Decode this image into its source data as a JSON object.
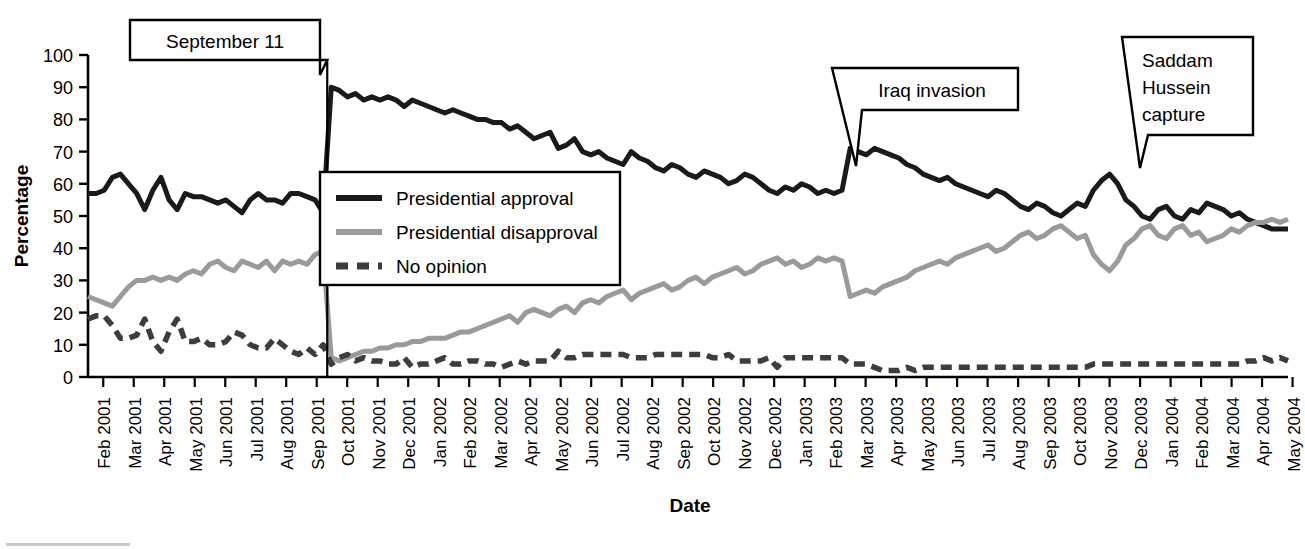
{
  "figure": {
    "background": "#ffffff",
    "axis_color": "#000000"
  },
  "axes": {
    "ylabel": "Percentage",
    "xlabel": "Date",
    "y_ticks": [
      "0",
      "10",
      "20",
      "30",
      "40",
      "50",
      "60",
      "70",
      "80",
      "90",
      "100"
    ],
    "x_ticks": [
      "Feb 2001",
      "Mar 2001",
      "Apr 2001",
      "May 2001",
      "Jun 2001",
      "Jul 2001",
      "Aug 2001",
      "Sep 2001",
      "Oct 2001",
      "Nov 2001",
      "Dec 2001",
      "Jan 2002",
      "Feb 2002",
      "Mar 2002",
      "Apr 2002",
      "May 2002",
      "Jun 2002",
      "Jul 2002",
      "Aug 2002",
      "Sep 2002",
      "Oct 2002",
      "Nov 2002",
      "Dec 2002",
      "Jan 2003",
      "Feb 2003",
      "Mar 2003",
      "Apr 2003",
      "May 2003",
      "Jun 2003",
      "Jul 2003",
      "Aug 2003",
      "Sep 2003",
      "Oct 2003",
      "Nov 2003",
      "Dec 2003",
      "Jan 2004",
      "Feb 2004",
      "Mar 2004",
      "Apr 2004",
      "May 2004"
    ]
  },
  "legend": {
    "position": "inside-upper-left",
    "entries": [
      {
        "label": "Presidential approval",
        "color": "#1a1a1a",
        "style": "solid"
      },
      {
        "label": "Presidential disapproval",
        "color": "#9a9a9a",
        "style": "solid"
      },
      {
        "label": "No opinion",
        "color": "#3d3d3d",
        "style": "dashed"
      }
    ]
  },
  "annotations": [
    {
      "name": "september-11",
      "text": "September 11",
      "lines": [
        "September 11"
      ]
    },
    {
      "name": "iraq-invasion",
      "text": "Iraq invasion",
      "lines": [
        "Iraq invasion"
      ]
    },
    {
      "name": "saddam-hussein-capture",
      "text": "Saddam Hussein capture",
      "lines": [
        "Saddam",
        "Hussein",
        "capture"
      ]
    }
  ],
  "chart_data": {
    "type": "line",
    "title": "",
    "xlabel": "Date",
    "ylabel": "Percentage",
    "ylim": [
      0,
      100
    ],
    "ytick_step": 10,
    "grid": false,
    "legend_position": "inside upper-left",
    "x_unit": "poll (approximately weekly, Feb 2001 - May 2004)",
    "x_axis_labels": [
      "Feb 2001",
      "Mar 2001",
      "Apr 2001",
      "May 2001",
      "Jun 2001",
      "Jul 2001",
      "Aug 2001",
      "Sep 2001",
      "Oct 2001",
      "Nov 2001",
      "Dec 2001",
      "Jan 2002",
      "Feb 2002",
      "Mar 2002",
      "Apr 2002",
      "May 2002",
      "Jun 2002",
      "Jul 2002",
      "Aug 2002",
      "Sep 2002",
      "Oct 2002",
      "Nov 2002",
      "Dec 2002",
      "Jan 2003",
      "Feb 2003",
      "Mar 2003",
      "Apr 2003",
      "May 2003",
      "Jun 2003",
      "Jul 2003",
      "Aug 2003",
      "Sep 2003",
      "Oct 2003",
      "Nov 2003",
      "Dec 2003",
      "Jan 2004",
      "Feb 2004",
      "Mar 2004",
      "Apr 2004",
      "May 2004"
    ],
    "events": [
      {
        "label": "September 11",
        "x_index": 30
      },
      {
        "label": "Iraq invasion",
        "x_index": 94
      },
      {
        "label": "Saddam Hussein capture",
        "x_index": 124
      }
    ],
    "series": [
      {
        "name": "Presidential approval",
        "color": "#1a1a1a",
        "style": "solid",
        "values": [
          57,
          57,
          58,
          62,
          63,
          60,
          57,
          52,
          58,
          62,
          55,
          52,
          57,
          56,
          56,
          55,
          54,
          55,
          53,
          51,
          55,
          57,
          55,
          55,
          54,
          57,
          57,
          56,
          55,
          51,
          90,
          89,
          87,
          88,
          86,
          87,
          86,
          87,
          86,
          84,
          86,
          85,
          84,
          83,
          82,
          83,
          82,
          81,
          80,
          80,
          79,
          79,
          77,
          78,
          76,
          74,
          75,
          76,
          71,
          72,
          74,
          70,
          69,
          70,
          68,
          67,
          66,
          70,
          68,
          67,
          65,
          64,
          66,
          65,
          63,
          62,
          64,
          63,
          62,
          60,
          61,
          63,
          62,
          60,
          58,
          57,
          59,
          58,
          60,
          59,
          57,
          58,
          57,
          58,
          71,
          70,
          69,
          71,
          70,
          69,
          68,
          66,
          65,
          63,
          62,
          61,
          62,
          60,
          59,
          58,
          57,
          56,
          58,
          57,
          55,
          53,
          52,
          54,
          53,
          51,
          50,
          52,
          54,
          53,
          58,
          61,
          63,
          60,
          55,
          53,
          50,
          49,
          52,
          53,
          50,
          49,
          52,
          51,
          54,
          53,
          52,
          50,
          51,
          49,
          48,
          47,
          46,
          46,
          46
        ],
        "n": 159
      },
      {
        "name": "Presidential disapproval",
        "color": "#9a9a9a",
        "style": "solid",
        "values": [
          25,
          24,
          23,
          22,
          25,
          28,
          30,
          30,
          31,
          30,
          31,
          30,
          32,
          33,
          32,
          35,
          36,
          34,
          33,
          36,
          35,
          34,
          36,
          33,
          36,
          35,
          36,
          35,
          38,
          39,
          6,
          5,
          6,
          7,
          8,
          8,
          9,
          9,
          10,
          10,
          11,
          11,
          12,
          12,
          12,
          13,
          14,
          14,
          15,
          16,
          17,
          18,
          19,
          17,
          20,
          21,
          20,
          19,
          21,
          22,
          20,
          23,
          24,
          23,
          25,
          26,
          27,
          24,
          26,
          27,
          28,
          29,
          27,
          28,
          30,
          31,
          29,
          31,
          32,
          33,
          34,
          32,
          33,
          35,
          36,
          37,
          35,
          36,
          34,
          35,
          37,
          36,
          37,
          36,
          25,
          26,
          27,
          26,
          28,
          29,
          30,
          31,
          33,
          34,
          35,
          36,
          35,
          37,
          38,
          39,
          40,
          41,
          39,
          40,
          42,
          44,
          45,
          43,
          44,
          46,
          47,
          45,
          43,
          44,
          38,
          35,
          33,
          36,
          41,
          43,
          46,
          47,
          44,
          43,
          46,
          47,
          44,
          45,
          42,
          43,
          44,
          46,
          45,
          47,
          48,
          48,
          49,
          48,
          49
        ],
        "n": 159
      },
      {
        "name": "No opinion",
        "color": "#3d3d3d",
        "style": "dashed",
        "values": [
          18,
          19,
          19,
          16,
          12,
          12,
          13,
          18,
          11,
          8,
          14,
          18,
          11,
          11,
          12,
          10,
          10,
          11,
          14,
          13,
          10,
          9,
          9,
          12,
          10,
          8,
          7,
          9,
          7,
          10,
          4,
          6,
          7,
          5,
          6,
          5,
          5,
          4,
          4,
          6,
          3,
          4,
          4,
          5,
          6,
          4,
          4,
          5,
          5,
          4,
          4,
          3,
          4,
          5,
          4,
          5,
          5,
          5,
          8,
          6,
          6,
          7,
          7,
          7,
          7,
          7,
          7,
          6,
          6,
          6,
          7,
          7,
          7,
          7,
          7,
          7,
          7,
          6,
          6,
          7,
          5,
          5,
          5,
          5,
          6,
          3,
          6,
          6,
          6,
          6,
          6,
          6,
          6,
          6,
          4,
          4,
          4,
          3,
          2,
          2,
          2,
          3,
          2,
          3,
          3,
          3,
          3,
          3,
          3,
          3,
          3,
          3,
          3,
          3,
          3,
          3,
          3,
          3,
          3,
          3,
          3,
          3,
          3,
          3,
          4,
          4,
          4,
          4,
          4,
          4,
          4,
          4,
          4,
          4,
          4,
          4,
          4,
          4,
          4,
          4,
          4,
          4,
          4,
          5,
          5,
          6,
          5,
          6,
          5
        ],
        "n": 159
      }
    ]
  }
}
